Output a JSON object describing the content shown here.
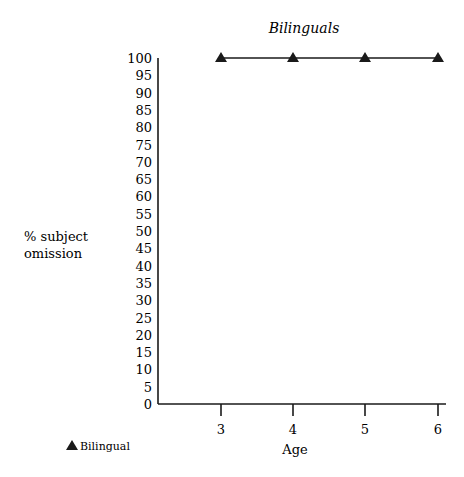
{
  "chart_data": {
    "type": "line",
    "title": "Bilinguals",
    "xlabel": "Age",
    "ylabel_lines": [
      "% subject",
      "omission"
    ],
    "x": [
      3,
      4,
      5,
      6
    ],
    "categories": [
      "3",
      "4",
      "5",
      "6"
    ],
    "series": [
      {
        "name": "Bilingual",
        "marker": "triangle",
        "values": [
          100,
          100,
          100,
          100
        ]
      }
    ],
    "ylim": [
      0,
      100
    ],
    "yticks": [
      0,
      5,
      10,
      15,
      20,
      25,
      30,
      35,
      40,
      45,
      50,
      55,
      60,
      65,
      70,
      75,
      80,
      85,
      90,
      95,
      100
    ],
    "grid": false,
    "legend_position": "bottom-left"
  },
  "legend": {
    "marker": "▲",
    "label": "Bilingual"
  },
  "colors": {
    "line": "#1a1a1a",
    "background": "#ffffff"
  }
}
